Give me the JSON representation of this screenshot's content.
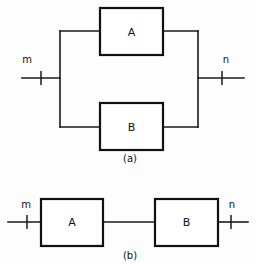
{
  "figure": {
    "background_color": "#fdfdfd",
    "line_color": "#1a1a1a",
    "box_fill": "#ffffff",
    "box_stroke": "#111111",
    "panels": [
      {
        "caption": "(a)",
        "topology": "parallel",
        "blocks": [
          {
            "label": "A",
            "position": "top"
          },
          {
            "label": "B",
            "position": "bottom"
          }
        ],
        "terminals": [
          {
            "label": "m",
            "side": "left"
          },
          {
            "label": "n",
            "side": "right"
          }
        ]
      },
      {
        "caption": "(b)",
        "topology": "series",
        "blocks": [
          {
            "label": "A",
            "position": "left"
          },
          {
            "label": "B",
            "position": "right"
          }
        ],
        "terminals": [
          {
            "label": "m",
            "side": "left"
          },
          {
            "label": "n",
            "side": "right"
          }
        ]
      }
    ]
  },
  "panel_a": {
    "block_a_label": "A",
    "block_b_label": "B",
    "terminal_m_label": "m",
    "terminal_n_label": "n",
    "caption": "(a)"
  },
  "panel_b": {
    "block_a_label": "A",
    "block_b_label": "B",
    "terminal_m_label": "m",
    "terminal_n_label": "n",
    "caption": "(b)"
  }
}
